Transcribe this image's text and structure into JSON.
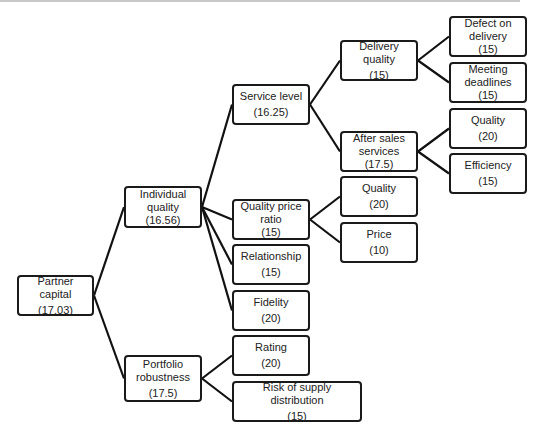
{
  "diagram": {
    "type": "tree",
    "root": "partner_capital",
    "nodes": [
      {
        "id": "partner_capital",
        "label": "Partner capital",
        "value": "(17.03)",
        "x": 17,
        "y": 275,
        "w": 77,
        "h": 41,
        "tight": false
      },
      {
        "id": "individual_quality",
        "label": "Individual quality",
        "value": "(16.56)",
        "x": 124,
        "y": 186,
        "w": 78,
        "h": 42,
        "tight": true
      },
      {
        "id": "portfolio_robustness",
        "label": "Portfolio robustness",
        "value": "(17.5)",
        "x": 124,
        "y": 355,
        "w": 78,
        "h": 47,
        "tight": false
      },
      {
        "id": "service_level",
        "label": "Service level",
        "value": "(16.25)",
        "x": 232,
        "y": 84,
        "w": 78,
        "h": 41,
        "tight": false
      },
      {
        "id": "quality_price_ratio",
        "label": "Quality price ratio",
        "value": "(15)",
        "x": 232,
        "y": 199,
        "w": 78,
        "h": 41,
        "tight": true
      },
      {
        "id": "relationship",
        "label": "Relationship",
        "value": "(15)",
        "x": 232,
        "y": 244,
        "w": 78,
        "h": 41,
        "tight": false
      },
      {
        "id": "fidelity",
        "label": "Fidelity",
        "value": "(20)",
        "x": 232,
        "y": 290,
        "w": 78,
        "h": 41,
        "tight": false
      },
      {
        "id": "rating",
        "label": "Rating",
        "value": "(20)",
        "x": 232,
        "y": 335,
        "w": 78,
        "h": 41,
        "tight": false
      },
      {
        "id": "risk_supply",
        "label": "Risk of supply distribution",
        "value": "(15)",
        "x": 232,
        "y": 381,
        "w": 130,
        "h": 41,
        "tight": false
      },
      {
        "id": "delivery_quality",
        "label": "Delivery quality",
        "value": "(15)",
        "x": 340,
        "y": 40,
        "w": 78,
        "h": 41,
        "tight": false
      },
      {
        "id": "after_sales",
        "label": "After sales services",
        "value": "(17.5)",
        "x": 340,
        "y": 131,
        "w": 78,
        "h": 41,
        "tight": true
      },
      {
        "id": "qpr_quality",
        "label": "Quality",
        "value": "(20)",
        "x": 340,
        "y": 176,
        "w": 78,
        "h": 41,
        "tight": false
      },
      {
        "id": "qpr_price",
        "label": "Price",
        "value": "(10)",
        "x": 340,
        "y": 222,
        "w": 78,
        "h": 41,
        "tight": false
      },
      {
        "id": "defect_delivery",
        "label": "Defect on delivery",
        "value": "(15)",
        "x": 449,
        "y": 16,
        "w": 78,
        "h": 41,
        "tight": true
      },
      {
        "id": "meeting_deadlines",
        "label": "Meeting deadlines",
        "value": "(15)",
        "x": 449,
        "y": 62,
        "w": 78,
        "h": 41,
        "tight": true
      },
      {
        "id": "as_quality",
        "label": "Quality",
        "value": "(20)",
        "x": 449,
        "y": 108,
        "w": 78,
        "h": 41,
        "tight": false
      },
      {
        "id": "as_efficiency",
        "label": "Efficiency",
        "value": "(15)",
        "x": 449,
        "y": 153,
        "w": 78,
        "h": 41,
        "tight": false
      }
    ],
    "edges": [
      [
        "partner_capital",
        "individual_quality"
      ],
      [
        "partner_capital",
        "portfolio_robustness"
      ],
      [
        "individual_quality",
        "service_level"
      ],
      [
        "individual_quality",
        "quality_price_ratio"
      ],
      [
        "individual_quality",
        "relationship"
      ],
      [
        "individual_quality",
        "fidelity"
      ],
      [
        "portfolio_robustness",
        "rating"
      ],
      [
        "portfolio_robustness",
        "risk_supply"
      ],
      [
        "service_level",
        "delivery_quality"
      ],
      [
        "service_level",
        "after_sales"
      ],
      [
        "quality_price_ratio",
        "qpr_quality"
      ],
      [
        "quality_price_ratio",
        "qpr_price"
      ],
      [
        "delivery_quality",
        "defect_delivery"
      ],
      [
        "delivery_quality",
        "meeting_deadlines"
      ],
      [
        "after_sales",
        "as_quality"
      ],
      [
        "after_sales",
        "as_efficiency"
      ]
    ],
    "colors": {
      "border": "#1a1a1a",
      "text": "#222222",
      "background": "#ffffff",
      "edge": "#111111"
    }
  }
}
